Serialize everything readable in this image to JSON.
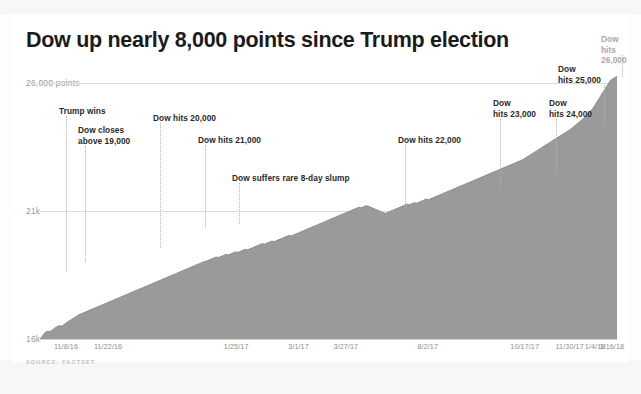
{
  "chart_data": {
    "type": "area",
    "title": "Dow up nearly 8,000 points since Trump election",
    "xlabel": "",
    "ylabel": "",
    "ylim": [
      16000,
      26500
    ],
    "grid": true,
    "legend": null,
    "source": "SOURCE: FACTSET",
    "series_name": "Dow Jones Industrial Average",
    "fill_color": "#9a9a9a",
    "line_color": "#8c8c8c",
    "y_ticks": [
      {
        "value": 26000,
        "label": "26,000 points"
      },
      {
        "value": 21000,
        "label": "21k"
      },
      {
        "value": 16000,
        "label": "16k"
      }
    ],
    "x_ticks": [
      {
        "label": "11/8/16",
        "pos": 0.045
      },
      {
        "label": "11/22/16",
        "pos": 0.118
      },
      {
        "label": "1/25/17",
        "pos": 0.34
      },
      {
        "label": "3/1/17",
        "pos": 0.448
      },
      {
        "label": "3/27/17",
        "pos": 0.53
      },
      {
        "label": "8/2/17",
        "pos": 0.672
      },
      {
        "label": "10/17/17",
        "pos": 0.84
      },
      {
        "label": "11/30/17",
        "pos": 0.918
      },
      {
        "label": "1/4/18",
        "pos": 0.962
      },
      {
        "label": "1/16/18",
        "pos": 0.991
      }
    ],
    "annotations": [
      {
        "text": "Trump wins",
        "label_x": 47,
        "label_y": 92,
        "leader_x": 54,
        "leader_top": 102,
        "leader_bottom": 258,
        "muted": false
      },
      {
        "text": "Dow closes\nabove 19,000",
        "label_x": 66,
        "label_y": 111,
        "leader_x": 73,
        "leader_top": 132,
        "leader_bottom": 248,
        "muted": false
      },
      {
        "text": "Dow hits 20,000",
        "label_x": 141,
        "label_y": 99,
        "leader_x": 148,
        "leader_top": 109,
        "leader_bottom": 234,
        "muted": false
      },
      {
        "text": "Dow hits 21,000",
        "label_x": 186,
        "label_y": 121,
        "leader_x": 193,
        "leader_top": 131,
        "leader_bottom": 213,
        "muted": false
      },
      {
        "text": "Dow suffers rare 8-day slump",
        "label_x": 220,
        "label_y": 159,
        "leader_x": 227,
        "leader_top": 169,
        "leader_bottom": 210,
        "muted": false
      },
      {
        "text": "Dow hits 22,000",
        "label_x": 386,
        "label_y": 121,
        "leader_x": 393,
        "leader_top": 131,
        "leader_bottom": 196,
        "muted": false
      },
      {
        "text": "Dow\nhits 23,000",
        "label_x": 481,
        "label_y": 84,
        "leader_x": 488,
        "leader_top": 105,
        "leader_bottom": 175,
        "muted": false
      },
      {
        "text": "Dow\nhits 24,000",
        "label_x": 537,
        "label_y": 84,
        "leader_x": 544,
        "leader_top": 105,
        "leader_bottom": 158,
        "muted": false
      },
      {
        "text": "Dow\nhits 25,000",
        "label_x": 546,
        "label_y": 50,
        "leader_x": 592,
        "leader_top": 71,
        "leader_bottom": 112,
        "muted": false
      },
      {
        "text": "Dow hits\n26,000",
        "label_x": 589,
        "label_y": 20,
        "leader_x": 610,
        "leader_top": 41,
        "leader_bottom": 62,
        "muted": true
      }
    ],
    "values": [
      16000,
      16120,
      16240,
      16300,
      16280,
      16340,
      16420,
      16480,
      16520,
      16500,
      16560,
      16640,
      16700,
      16760,
      16820,
      16880,
      16940,
      16980,
      17020,
      17060,
      17100,
      17140,
      17180,
      17220,
      17260,
      17300,
      17340,
      17380,
      17420,
      17460,
      17500,
      17540,
      17580,
      17620,
      17660,
      17700,
      17740,
      17780,
      17820,
      17860,
      17900,
      17940,
      17980,
      18020,
      18060,
      18100,
      18140,
      18180,
      18220,
      18260,
      18300,
      18340,
      18380,
      18420,
      18460,
      18500,
      18540,
      18580,
      18620,
      18660,
      18700,
      18740,
      18780,
      18820,
      18860,
      18900,
      18940,
      18980,
      19020,
      19040,
      19080,
      19120,
      19160,
      19200,
      19180,
      19220,
      19260,
      19300,
      19280,
      19320,
      19360,
      19400,
      19380,
      19420,
      19460,
      19500,
      19480,
      19520,
      19560,
      19600,
      19640,
      19680,
      19720,
      19700,
      19740,
      19780,
      19820,
      19800,
      19840,
      19880,
      19920,
      19960,
      20000,
      20040,
      20020,
      20060,
      20100,
      20140,
      20180,
      20220,
      20260,
      20300,
      20340,
      20380,
      20420,
      20460,
      20500,
      20540,
      20580,
      20620,
      20660,
      20700,
      20740,
      20780,
      20820,
      20860,
      20900,
      20940,
      20980,
      21020,
      21060,
      21100,
      21140,
      21120,
      21160,
      21200,
      21180,
      21140,
      21100,
      21060,
      21020,
      20980,
      20940,
      20900,
      20940,
      20980,
      21020,
      21060,
      21100,
      21140,
      21180,
      21220,
      21260,
      21240,
      21280,
      21320,
      21300,
      21340,
      21380,
      21420,
      21460,
      21440,
      21480,
      21520,
      21560,
      21600,
      21640,
      21680,
      21720,
      21760,
      21800,
      21840,
      21880,
      21920,
      21960,
      22000,
      22040,
      22080,
      22120,
      22160,
      22200,
      22240,
      22280,
      22320,
      22360,
      22400,
      22440,
      22480,
      22520,
      22560,
      22600,
      22640,
      22680,
      22720,
      22760,
      22800,
      22840,
      22880,
      22920,
      22960,
      23000,
      23060,
      23120,
      23180,
      23240,
      23300,
      23360,
      23420,
      23480,
      23540,
      23600,
      23660,
      23720,
      23780,
      23840,
      23900,
      23960,
      24020,
      24080,
      24140,
      24200,
      24280,
      24360,
      24440,
      24520,
      24600,
      24700,
      24800,
      24900,
      25000,
      25150,
      25300,
      25450,
      25600,
      25750,
      25900,
      26050,
      26150,
      26200,
      26250
    ]
  }
}
